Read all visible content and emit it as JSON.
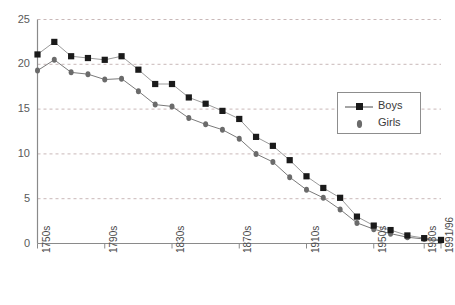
{
  "chart_data": {
    "type": "line",
    "title": "",
    "subtitle": "",
    "xlabel": "",
    "ylabel": "",
    "ylim": [
      0,
      25
    ],
    "ytick_values": [
      0,
      5,
      10,
      15,
      20,
      25
    ],
    "ytick_labels": [
      "0",
      "5",
      "10",
      "15",
      "20",
      "25"
    ],
    "grid": "horizontal-dashed",
    "legend_position": "right-upper-inside",
    "x_tick_labels": [
      "1750s",
      "1790s",
      "1830s",
      "1870s",
      "1910s",
      "1950s",
      "1980s",
      "1991/96"
    ],
    "x_tick_indices": [
      0,
      4,
      8,
      12,
      16,
      20,
      23,
      24
    ],
    "x": [
      "1750s",
      "1760s",
      "1770s",
      "1780s",
      "1790s",
      "1800s",
      "1810s",
      "1820s",
      "1830s",
      "1840s",
      "1850s",
      "1860s",
      "1870s",
      "1880s",
      "1890s",
      "1900s",
      "1910s",
      "1920s",
      "1930s",
      "1940s",
      "1950s",
      "1960s",
      "1970s",
      "1980s",
      "1991/96"
    ],
    "series": [
      {
        "name": "Boys",
        "color": "#1a1a1a",
        "marker": "square",
        "values": [
          21.1,
          22.5,
          20.9,
          20.7,
          20.5,
          20.9,
          19.4,
          17.8,
          17.8,
          16.3,
          15.6,
          14.8,
          13.9,
          11.9,
          10.9,
          9.3,
          7.5,
          6.2,
          5.1,
          3.0,
          2.0,
          1.5,
          0.9,
          0.6,
          0.4
        ]
      },
      {
        "name": "Girls",
        "color": "#6b6b6b",
        "marker": "circle",
        "values": [
          19.3,
          20.5,
          19.1,
          18.9,
          18.3,
          18.4,
          17.0,
          15.5,
          15.3,
          14.0,
          13.3,
          12.7,
          11.7,
          10.0,
          9.1,
          7.4,
          6.0,
          5.1,
          3.8,
          2.3,
          1.6,
          1.1,
          0.7,
          0.5,
          0.3
        ]
      }
    ]
  },
  "legend": {
    "items": [
      {
        "label": "Boys"
      },
      {
        "label": "Girls"
      }
    ]
  }
}
